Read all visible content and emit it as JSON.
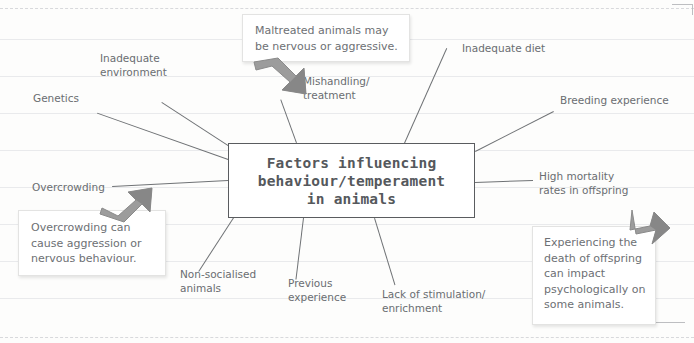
{
  "page": {
    "background_color": "#fdfdfc",
    "rule_line_color": "#e9eaec",
    "ink_color": "#6a6d71"
  },
  "central_node": {
    "text": "Factors influencing\nbehaviour/temperament\nin animals",
    "border_color": "#5a5c5f",
    "fill_color": "#ffffff"
  },
  "branches": [
    {
      "id": "genetics",
      "label": "Genetics"
    },
    {
      "id": "inadequate-environment",
      "label": "Inadequate\nenvironment"
    },
    {
      "id": "mishandling-treatment",
      "label": "Mishandling/\ntreatment"
    },
    {
      "id": "inadequate-diet",
      "label": "Inadequate diet"
    },
    {
      "id": "breeding-experience",
      "label": "Breeding experience"
    },
    {
      "id": "high-mortality",
      "label": "High mortality\nrates in offspring"
    },
    {
      "id": "overcrowding",
      "label": "Overcrowding"
    },
    {
      "id": "non-socialised",
      "label": "Non-socialised\nanimals"
    },
    {
      "id": "previous-experience",
      "label": "Previous\nexperience"
    },
    {
      "id": "lack-of-stimulation",
      "label": "Lack of stimulation/\nenrichment"
    }
  ],
  "callouts": [
    {
      "id": "maltreated-note",
      "text": "Maltreated animals may\nbe nervous or aggressive.",
      "points_to": "mishandling-treatment",
      "arrow_direction": "down-right"
    },
    {
      "id": "overcrowding-note",
      "text": "Overcrowding can\ncause aggression or\nnervous behaviour.",
      "points_to": "overcrowding",
      "arrow_direction": "up-right"
    },
    {
      "id": "offspring-death-note",
      "text": "Experiencing the\ndeath of offspring\ncan impact\npsychologically on\nsome animals.",
      "points_to": "high-mortality",
      "arrow_direction": "up-left"
    }
  ],
  "arrows": {
    "fill_color": "#9a9a9a",
    "shade_color": "#7d7d7d"
  }
}
